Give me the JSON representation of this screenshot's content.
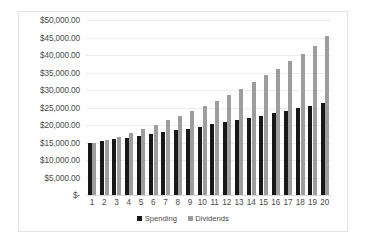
{
  "chart_data": {
    "type": "bar",
    "title": "",
    "xlabel": "",
    "ylabel": "",
    "grid": true,
    "legend_position": "bottom",
    "ylim": [
      0,
      50000
    ],
    "yticks": [
      0,
      5000,
      10000,
      15000,
      20000,
      25000,
      30000,
      35000,
      40000,
      45000,
      50000
    ],
    "ytick_labels": [
      "$-",
      "$5,000.00",
      "$10,000.00",
      "$15,000.00",
      "$20,000.00",
      "$25,000.00",
      "$30,000.00",
      "$35,000.00",
      "$40,000.00",
      "$45,000.00",
      "$50,000.00"
    ],
    "categories": [
      "1",
      "2",
      "3",
      "4",
      "5",
      "6",
      "7",
      "8",
      "9",
      "10",
      "11",
      "12",
      "13",
      "14",
      "15",
      "16",
      "17",
      "18",
      "19",
      "20"
    ],
    "series": [
      {
        "name": "Spending",
        "color": "#181818",
        "values": [
          15000,
          15450,
          15914,
          16391,
          16883,
          17389,
          17911,
          18448,
          19002,
          19572,
          20159,
          20764,
          21387,
          22028,
          22689,
          23370,
          24071,
          24793,
          25537,
          26303
        ]
      },
      {
        "name": "Dividends",
        "color": "#9d9d9d",
        "values": [
          15000,
          15600,
          16650,
          17800,
          18950,
          20100,
          21400,
          22700,
          23950,
          25300,
          26800,
          28500,
          30300,
          32300,
          34200,
          36100,
          38200,
          40400,
          42700,
          45400
        ]
      }
    ]
  },
  "legend": {
    "items": [
      {
        "label": "Spending",
        "color": "#181818"
      },
      {
        "label": "Dividends",
        "color": "#9d9d9d"
      }
    ]
  }
}
